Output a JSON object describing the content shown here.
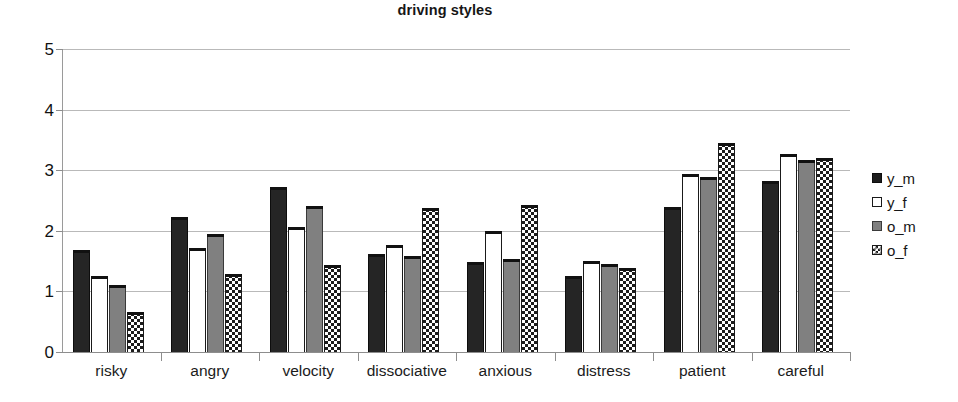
{
  "chart_data": {
    "type": "bar",
    "title": "driving styles",
    "xlabel": "",
    "ylabel": "",
    "ylim": [
      0,
      5
    ],
    "ytick_labels": [
      "5",
      "4",
      "3",
      "2",
      "1",
      "0"
    ],
    "ytick_values": [
      5,
      4,
      3,
      2,
      1,
      0
    ],
    "grid": true,
    "legend_position": "right",
    "categories": [
      "risky",
      "angry",
      "velocity",
      "dissociative",
      "anxious",
      "distress",
      "patient",
      "careful"
    ],
    "series": [
      {
        "name": "y_m",
        "color": "#252525",
        "fill": "solid-dark",
        "values": [
          1.69,
          2.23,
          2.73,
          1.62,
          1.48,
          1.26,
          2.4,
          2.82
        ]
      },
      {
        "name": "y_f",
        "color": "#ffffff",
        "fill": "empty-white",
        "values": [
          1.25,
          1.72,
          2.07,
          1.77,
          2.0,
          1.5,
          2.93,
          3.26
        ]
      },
      {
        "name": "o_m",
        "color": "#808080",
        "fill": "solid-gray",
        "values": [
          1.11,
          1.94,
          2.41,
          1.58,
          1.53,
          1.45,
          2.88,
          3.17
        ]
      },
      {
        "name": "o_f",
        "color": "#1c1c1c",
        "fill": "checkerboard",
        "values": [
          0.66,
          1.29,
          1.43,
          2.37,
          2.43,
          1.38,
          3.45,
          3.2
        ]
      }
    ]
  },
  "legend": {
    "items": [
      {
        "label": "y_m",
        "series": "y_m"
      },
      {
        "label": "y_f",
        "series": "y_f"
      },
      {
        "label": "o_m",
        "series": "o_m"
      },
      {
        "label": "o_f",
        "series": "o_f"
      }
    ]
  }
}
